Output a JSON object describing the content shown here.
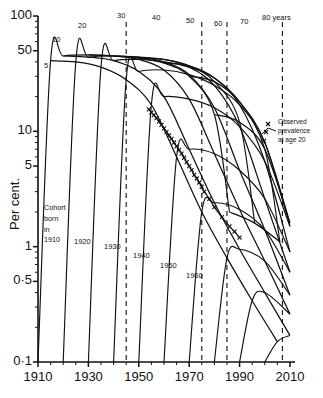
{
  "chart_data": {
    "type": "line",
    "title": "",
    "subtitle": "",
    "xlabel": "",
    "ylabel": "Per cent.",
    "yscale": "log",
    "ylim": [
      0.1,
      100
    ],
    "xlim": [
      1910,
      2012
    ],
    "grid": false,
    "legend_position": "inline-annotations",
    "y_tick_labels": [
      "100",
      "50",
      "10",
      "5",
      "1",
      "0·5",
      "0·1"
    ],
    "y_tick_values": [
      100,
      50,
      10,
      5,
      1,
      0.5,
      0.1
    ],
    "y_minor_tick_values": [
      90,
      80,
      70,
      60,
      40,
      30,
      20,
      9,
      8,
      7,
      6,
      4,
      3,
      2,
      0.9,
      0.8,
      0.7,
      0.6,
      0.4,
      0.3,
      0.2
    ],
    "x_tick_labels": [
      "1910",
      "1930",
      "1950",
      "1970",
      "1990",
      "2010"
    ],
    "x_tick_values": [
      1910,
      1930,
      1950,
      1970,
      1990,
      2010
    ],
    "x_minor_tick_values": [
      1915,
      1920,
      1925,
      1935,
      1940,
      1945,
      1955,
      1960,
      1965,
      1975,
      1980,
      1985,
      1995,
      2000,
      2005
    ],
    "age_curve_label_unit": "years",
    "age_curve_labels": [
      "5",
      "10",
      "20",
      "30",
      "40",
      "50",
      "60",
      "70",
      "80 years"
    ],
    "age_curve_values": [
      5,
      10,
      20,
      30,
      40,
      50,
      60,
      70,
      80
    ],
    "cohort_labels": [
      "Cohort\nborn\nin\n1910",
      "1920",
      "1930",
      "1940",
      "1950",
      "1960"
    ],
    "cohort_values": [
      1910,
      1920,
      1930,
      1940,
      1950,
      1960
    ],
    "annotation_observed": "Observed\nprevalence\nat age 20",
    "dashed_reference_years": [
      1945,
      1975,
      1985,
      2007
    ],
    "marker_symbol": "x",
    "series": [
      {
        "name": "Observed prevalence at age 20",
        "marker": "x",
        "x": [
          1954,
          1955,
          1956,
          1957,
          1958,
          1959,
          1960,
          1961,
          1962,
          1963,
          1964,
          1965,
          1966,
          1967,
          1968,
          1969,
          1970,
          1971,
          1972,
          1973,
          1974,
          1975,
          1976,
          1978,
          1980,
          1983,
          1986,
          1988,
          1990
        ],
        "y": [
          15.5,
          14.6,
          13.8,
          13.0,
          12.2,
          11.4,
          10.6,
          9.9,
          9.2,
          8.6,
          8.0,
          7.4,
          6.9,
          6.4,
          5.9,
          5.4,
          5.0,
          4.6,
          4.2,
          3.9,
          3.6,
          3.3,
          3.0,
          2.6,
          2.2,
          1.8,
          1.5,
          1.35,
          1.2
        ]
      },
      {
        "name": "Cohort born in 1910",
        "x": [
          1910,
          1915,
          1920,
          1930,
          1940,
          1950,
          1960,
          1970,
          1980,
          1986
        ],
        "y": [
          0.1,
          41,
          45,
          46,
          45,
          43,
          39,
          30,
          14,
          2
        ]
      },
      {
        "name": "Cohort born in 1920",
        "x": [
          1920,
          1925,
          1930,
          1940,
          1950,
          1960,
          1970,
          1980,
          1990,
          1996
        ],
        "y": [
          0.1,
          40,
          44,
          45,
          44,
          42,
          37,
          27,
          12,
          1.6
        ]
      },
      {
        "name": "Cohort born in 1930",
        "x": [
          1930,
          1935,
          1940,
          1950,
          1960,
          1970,
          1980,
          1990,
          2000,
          2006
        ],
        "y": [
          0.1,
          36,
          41,
          42,
          40,
          36,
          29,
          18,
          7,
          1.1
        ]
      },
      {
        "name": "Cohort born in 1940",
        "x": [
          1940,
          1945,
          1950,
          1960,
          1970,
          1980,
          1990,
          2000,
          2010
        ],
        "y": [
          0.1,
          28,
          33,
          34,
          31,
          25,
          17,
          8,
          1.6
        ]
      },
      {
        "name": "Cohort born in 1950",
        "x": [
          1950,
          1955,
          1960,
          1970,
          1980,
          1990,
          2000,
          2010
        ],
        "y": [
          0.1,
          17,
          20,
          19,
          16,
          11,
          5.5,
          1.5
        ]
      },
      {
        "name": "Cohort born in 1960",
        "x": [
          1960,
          1965,
          1970,
          1980,
          1990,
          2000,
          2010
        ],
        "y": [
          0.1,
          6.0,
          7.0,
          6.4,
          4.6,
          2.6,
          0.9
        ]
      },
      {
        "name": "Cohort born in 1970",
        "x": [
          1970,
          1975,
          1980,
          1990,
          2000,
          2010
        ],
        "y": [
          0.1,
          2.0,
          2.4,
          2.1,
          1.4,
          0.6
        ]
      },
      {
        "name": "Cohort born in 1980",
        "x": [
          1980,
          1985,
          1990,
          2000,
          2010
        ],
        "y": [
          0.1,
          0.8,
          0.95,
          0.75,
          0.38
        ]
      },
      {
        "name": "Cohort born in 1990",
        "x": [
          1990,
          1995,
          2000,
          2010
        ],
        "y": [
          0.1,
          0.34,
          0.4,
          0.26
        ]
      },
      {
        "name": "Cohort born in 2000",
        "x": [
          2000,
          2005,
          2010
        ],
        "y": [
          0.1,
          0.15,
          0.17
        ]
      }
    ],
    "age_isopleths": [
      {
        "age": 5,
        "x": [
          1915,
          1925,
          1935,
          1945,
          1955,
          1965,
          1975,
          1985,
          1995,
          2005
        ],
        "y": [
          41,
          40,
          36,
          28,
          17,
          6.0,
          2.0,
          0.8,
          0.34,
          0.15
        ]
      },
      {
        "age": 10,
        "x": [
          1920,
          1930,
          1940,
          1950,
          1960,
          1970,
          1980,
          1990,
          2000,
          2010
        ],
        "y": [
          45,
          44,
          41,
          33,
          20,
          7.0,
          2.4,
          0.95,
          0.4,
          0.17
        ]
      },
      {
        "age": 20,
        "x": [
          1930,
          1940,
          1950,
          1960,
          1970,
          1980,
          1990,
          2000,
          2010
        ],
        "y": [
          46,
          45,
          42,
          34,
          19,
          6.4,
          2.1,
          0.75,
          0.26
        ]
      },
      {
        "age": 30,
        "x": [
          1940,
          1950,
          1960,
          1970,
          1980,
          1990,
          2000,
          2010
        ],
        "y": [
          45,
          44,
          40,
          31,
          16,
          4.6,
          1.4,
          0.38
        ]
      },
      {
        "age": 40,
        "x": [
          1950,
          1960,
          1970,
          1980,
          1990,
          2000,
          2010
        ],
        "y": [
          43,
          42,
          36,
          25,
          11,
          2.6,
          0.6
        ]
      },
      {
        "age": 50,
        "x": [
          1960,
          1970,
          1980,
          1990,
          2000,
          2010
        ],
        "y": [
          39,
          37,
          29,
          17,
          5.5,
          0.9
        ]
      },
      {
        "age": 60,
        "x": [
          1970,
          1980,
          1990,
          2000,
          2010
        ],
        "y": [
          30,
          27,
          18,
          8,
          1.5
        ]
      },
      {
        "age": 70,
        "x": [
          1980,
          1990,
          2000,
          2010
        ],
        "y": [
          14,
          12,
          7,
          1.6
        ]
      },
      {
        "age": 80,
        "x": [
          1986,
          1996,
          2006
        ],
        "y": [
          2,
          1.6,
          1.1
        ]
      }
    ]
  },
  "axis": {
    "y_title": "Per cent."
  }
}
